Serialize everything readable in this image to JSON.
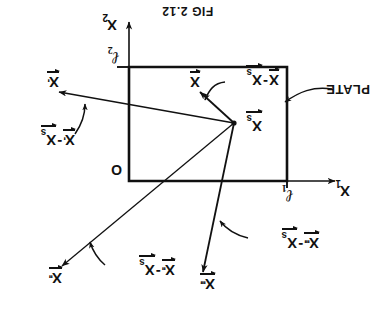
{
  "figure": {
    "caption": "FIG 2.12",
    "orientation": "rotated-180",
    "background_color": "#ffffff",
    "ink_color": "#111111"
  },
  "labels": {
    "plate": "PLATE",
    "origin": "O",
    "axis_x1": "X",
    "axis_x1_sub": "1",
    "axis_x2": "X",
    "axis_x2_sub": "2",
    "dim_l1": "ℓ",
    "dim_l1_sub": "1",
    "dim_l2": "ℓ",
    "dim_l2_sub": "2"
  },
  "vectors": {
    "source": {
      "symbol": "X",
      "subscript": "s",
      "primes": ""
    },
    "field": {
      "symbol": "X",
      "subscript": "",
      "primes": ""
    },
    "image1": {
      "symbol": "X",
      "subscript": "",
      "primes": "'"
    },
    "image2": {
      "symbol": "X",
      "subscript": "",
      "primes": "''"
    },
    "image3": {
      "symbol": "X",
      "subscript": "",
      "primes": "'''"
    }
  },
  "annotations": [
    {
      "id": "diff-x-xs",
      "minus": "-",
      "left": {
        "symbol": "X",
        "subscript": "",
        "primes": ""
      },
      "right": {
        "symbol": "X",
        "subscript": "s",
        "primes": ""
      }
    },
    {
      "id": "diff-xp-xs",
      "minus": "-",
      "left": {
        "symbol": "X",
        "subscript": "",
        "primes": "'"
      },
      "right": {
        "symbol": "X",
        "subscript": "s",
        "primes": ""
      }
    },
    {
      "id": "diff-xpp-xs",
      "minus": "-",
      "left": {
        "symbol": "X",
        "subscript": "",
        "primes": "''"
      },
      "right": {
        "symbol": "X",
        "subscript": "s",
        "primes": ""
      }
    },
    {
      "id": "diff-xppp-xs",
      "minus": "-",
      "left": {
        "symbol": "X",
        "subscript": "",
        "primes": "'''"
      },
      "right": {
        "symbol": "X",
        "subscript": "s",
        "primes": ""
      }
    }
  ]
}
